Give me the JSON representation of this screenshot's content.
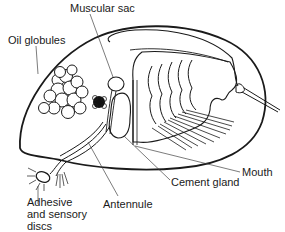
{
  "diagram": {
    "colors": {
      "line": "#1a1a1a",
      "leader": "#444444",
      "background": "#ffffff"
    },
    "labels": {
      "muscular_sac": "Muscular sac",
      "oil_globules": "Oil globules",
      "mouth": "Mouth",
      "cement_gland": "Cement gland",
      "antennule": "Antennule",
      "adhesive_line1": "Adhesive",
      "adhesive_line2": "and sensory",
      "adhesive_line3": "discs"
    }
  }
}
